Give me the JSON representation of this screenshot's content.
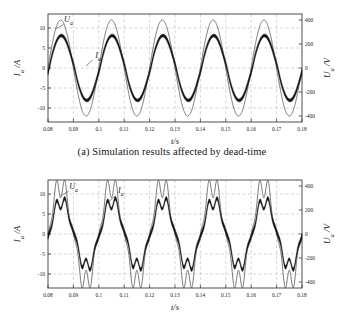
{
  "figure": {
    "panels": [
      {
        "id": "panel-a",
        "caption": "(a) Simulation results affected by dead-time",
        "chart_data": {
          "type": "line",
          "title": "",
          "xlabel": "t/s",
          "ylabel": "I_a / A",
          "y2label": "U_a /V",
          "xlim": [
            0.08,
            0.18
          ],
          "ylim": [
            -13.5,
            13.5
          ],
          "y2lim": [
            -450,
            450
          ],
          "xticks": [
            "0.08",
            "0.09",
            "0.1",
            "0.11",
            "0.12",
            "0.13",
            "0.14",
            "0.15",
            "0.16",
            "0.17",
            "0.18"
          ],
          "xtick_values": [
            0.08,
            0.09,
            0.1,
            0.11,
            0.12,
            0.13,
            0.14,
            0.15,
            0.16,
            0.17,
            0.18
          ],
          "yticks": [
            "10",
            "5",
            "0",
            "-5",
            "-10"
          ],
          "ytick_values": [
            10,
            5,
            0,
            -5,
            -10
          ],
          "y2ticks": [
            "400",
            "200",
            "0",
            "-200",
            "-400"
          ],
          "y2tick_values": [
            400,
            200,
            0,
            -200,
            -400
          ],
          "grid": true,
          "grid_style": "dashed",
          "legend": "inline-annotations",
          "annotations": [
            {
              "text": "U_a",
              "x": 0.0865,
              "y": 11.5
            },
            {
              "text": "I_a",
              "x": 0.0985,
              "y": 2.6
            }
          ],
          "series": [
            {
              "name": "U_a",
              "style": "thin",
              "axis": "right",
              "frequency_hz": 50,
              "amplitude_V": 400,
              "phase_deg": 0,
              "distortion": "none",
              "description": "Sinusoidal phase voltage, amplitude ~400 V, 50 Hz, peaks at t=0.085,0.105,0.125,0.145,0.165 s"
            },
            {
              "name": "I_a",
              "style": "thick-band",
              "axis": "left",
              "frequency_hz": 50,
              "amplitude_A": 8,
              "phase_deg": 0,
              "ripple_A": 0.8,
              "distortion": "dead-time flat-topping near zero crossings",
              "description": "Phase current, amplitude ~8 A, thick band from switching ripple, clamping distortion at zero crossings due to dead-time"
            }
          ]
        }
      },
      {
        "id": "panel-b",
        "caption": "(b) Simulation result affected by grid harmonics",
        "chart_data": {
          "type": "line",
          "title": "",
          "xlabel": "t/s",
          "ylabel": "I_a / A",
          "y2label": "U_a /V",
          "xlim": [
            0.08,
            0.18
          ],
          "ylim": [
            -13.5,
            13.5
          ],
          "y2lim": [
            -450,
            450
          ],
          "xticks": [
            "0.08",
            "0.09",
            "0.1",
            "0.11",
            "0.12",
            "0.13",
            "0.14",
            "0.15",
            "0.16",
            "0.17",
            "0.18"
          ],
          "xtick_values": [
            0.08,
            0.09,
            0.1,
            0.11,
            0.12,
            0.13,
            0.14,
            0.15,
            0.16,
            0.17,
            0.18
          ],
          "yticks": [
            "10",
            "5",
            "0",
            "-5",
            "-10"
          ],
          "ytick_values": [
            10,
            5,
            0,
            -5,
            -10
          ],
          "y2ticks": [
            "400",
            "200",
            "0",
            "-200",
            "-400"
          ],
          "y2tick_values": [
            400,
            200,
            0,
            -200,
            -400
          ],
          "grid": true,
          "grid_style": "dashed",
          "legend": "inline-annotations",
          "annotations": [
            {
              "text": "U_a",
              "x": 0.0885,
              "y": 11.3
            },
            {
              "text": "I_a",
              "x": 0.1075,
              "y": 10.2
            }
          ],
          "series": [
            {
              "name": "U_a",
              "style": "thin",
              "axis": "right",
              "frequency_hz": 50,
              "amplitude_V": 400,
              "phase_deg": 0,
              "distortion": "5th and 7th grid harmonics, flat-topped crests",
              "description": "Distorted grid voltage with harmonic content producing flattened and notched peaks"
            },
            {
              "name": "I_a",
              "style": "thick-band",
              "axis": "left",
              "frequency_hz": 50,
              "amplitude_A": 8,
              "phase_deg": 0,
              "ripple_A": 0.8,
              "distortion": "5th and 7th harmonic distortion",
              "description": "Phase current distorted by grid harmonics, thick band with switching ripple"
            }
          ]
        }
      }
    ]
  },
  "style": {
    "axis_color": "#3a3a3a",
    "grid_color": "#b9b9b9",
    "voltage_color": "#4a4a4a",
    "current_color": "#111111",
    "background": "#ffffff"
  }
}
